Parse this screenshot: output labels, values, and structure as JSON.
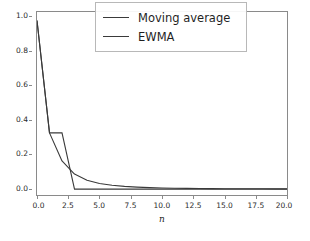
{
  "chart_data": {
    "type": "line",
    "title": "",
    "xlabel": "n",
    "ylabel": "",
    "xlim": [
      0.0,
      20.0
    ],
    "ylim": [
      -0.035,
      1.05
    ],
    "grid": false,
    "legend_position": "upper right",
    "xticks": [
      "0.0",
      "2.5",
      "5.0",
      "7.5",
      "10.0",
      "12.5",
      "15.0",
      "17.5",
      "20.0"
    ],
    "xtick_values": [
      0.0,
      2.5,
      5.0,
      7.5,
      10.0,
      12.5,
      15.0,
      17.5,
      20.0
    ],
    "yticks": [
      "0.0",
      "0.2",
      "0.4",
      "0.6",
      "0.8",
      "1.0"
    ],
    "ytick_values": [
      0.0,
      0.2,
      0.4,
      0.6,
      0.8,
      1.0
    ],
    "series": [
      {
        "name": "Moving average",
        "color": "#3a3a3a",
        "x": [
          0.0,
          1.0,
          2.0,
          3.0,
          20.0
        ],
        "values": [
          1.0,
          0.3333,
          0.3333,
          0.0,
          0.0
        ]
      },
      {
        "name": "EWMA",
        "color": "#3a3a3a",
        "x": [
          0.0,
          1.0,
          2.0,
          3.0,
          4.0,
          5.0,
          6.0,
          7.0,
          8.0,
          9.0,
          10.0,
          11.0,
          12.0,
          13.0,
          14.0,
          15.0,
          16.0,
          17.0,
          18.0,
          19.0,
          20.0
        ],
        "values": [
          1.0,
          0.3333,
          0.1667,
          0.0889,
          0.0526,
          0.0336,
          0.0228,
          0.0161,
          0.0118,
          0.0089,
          0.0069,
          0.0054,
          0.0044,
          0.0036,
          0.003,
          0.0025,
          0.0021,
          0.0018,
          0.0016,
          0.0014,
          0.0012
        ]
      }
    ]
  },
  "legend": {
    "entries": [
      {
        "label": "Moving average"
      },
      {
        "label": "EWMA"
      }
    ]
  },
  "axis": {
    "xlabel": "n"
  },
  "colors": {
    "line": "#3a3a3a",
    "frame": "#8a8a8a",
    "background": "#ffffff"
  }
}
